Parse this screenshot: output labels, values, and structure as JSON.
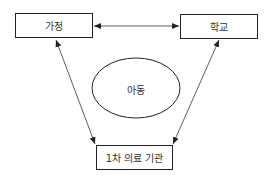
{
  "nodes": {
    "home": {
      "label": "가정"
    },
    "school": {
      "label": "학교"
    },
    "clinic": {
      "label": "1차 의료 기관"
    },
    "child": {
      "label": "아동"
    }
  },
  "edges": [
    {
      "from": "home",
      "to": "school",
      "type": "bidirectional"
    },
    {
      "from": "home",
      "to": "clinic",
      "type": "bidirectional"
    },
    {
      "from": "school",
      "to": "clinic",
      "type": "bidirectional"
    }
  ]
}
